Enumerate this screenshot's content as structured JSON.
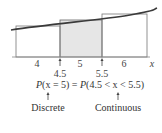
{
  "diagram": {
    "axis_variable": "x",
    "tick_labels": [
      "4",
      "5",
      "6"
    ],
    "boundary_labels": [
      "4.5",
      "5.5"
    ],
    "equation": {
      "lhs_func": "P",
      "lhs_arg": "(x = 5)",
      "equals": " = ",
      "rhs_func": "P",
      "rhs_arg": "(4.5 < x < 5.5)"
    },
    "captions": {
      "discrete": "Discrete",
      "continuous": "Continuous"
    },
    "bars": [
      {
        "from": 3.5,
        "to": 4.5,
        "shaded": false
      },
      {
        "from": 4.5,
        "to": 5.5,
        "shaded": true
      },
      {
        "from": 5.5,
        "to": 6.5,
        "shaded": false
      }
    ],
    "colors": {
      "shade": "#e6e6e6",
      "line": "#555555",
      "curve": "#333333"
    }
  }
}
